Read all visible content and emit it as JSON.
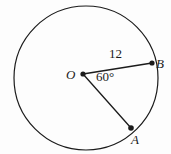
{
  "figure": {
    "kind": "circle-geometry-diagram",
    "background_color": "#fdfdfd",
    "stroke_color": "#1b1b1b",
    "circle": {
      "center_label": "O",
      "center_x": 86,
      "center_y": 78,
      "radius_px": 72,
      "stroke_width": 1.2
    },
    "points": [
      {
        "id": "O",
        "label": "O",
        "x": 83,
        "y": 74,
        "marker": "dot",
        "label_dx": -17,
        "label_dy": -6
      },
      {
        "id": "B",
        "label": "B",
        "x": 152,
        "y": 63,
        "marker": "dot",
        "label_dx": 4,
        "label_dy": -6
      },
      {
        "id": "A",
        "label": "A",
        "x": 131,
        "y": 128,
        "marker": "dot",
        "label_dx": 0,
        "label_dy": 5
      }
    ],
    "segments": [
      {
        "id": "OB",
        "from": "O",
        "to": "B",
        "length_label": "12"
      },
      {
        "id": "OA",
        "from": "O",
        "to": "A",
        "length_label": ""
      }
    ],
    "labels": {
      "center": "O",
      "point_b": "B",
      "point_a": "A",
      "radius_measure": "12",
      "angle_measure": "60°"
    },
    "angle": {
      "vertex": "O",
      "ray_1": "OB",
      "ray_2": "OA",
      "value": "60°",
      "degrees": 60
    }
  }
}
